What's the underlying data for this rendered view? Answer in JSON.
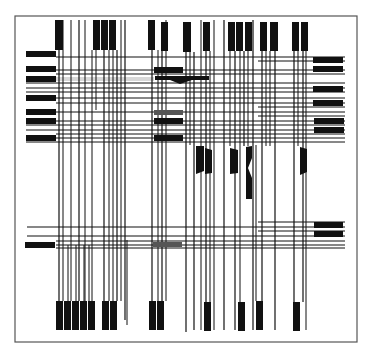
{
  "diagram": {
    "width": 372,
    "height": 353,
    "colors": {
      "background": "#ffffff",
      "frame": "#555555",
      "ink": "#111111",
      "grey_block": "#555555"
    },
    "frame": {
      "x": 15,
      "y": 16,
      "w": 342,
      "h": 326
    },
    "top_pins": [
      {
        "x": 55,
        "w": 8,
        "y1": 20,
        "y2": 50
      },
      {
        "x": 93,
        "w": 7,
        "y1": 20,
        "y2": 50
      },
      {
        "x": 101,
        "w": 7,
        "y1": 20,
        "y2": 50
      },
      {
        "x": 109,
        "w": 7,
        "y1": 20,
        "y2": 50
      },
      {
        "x": 148,
        "w": 7,
        "y1": 20,
        "y2": 50
      },
      {
        "x": 161,
        "w": 7,
        "y1": 22,
        "y2": 51
      },
      {
        "x": 183,
        "w": 8,
        "y1": 22,
        "y2": 52
      },
      {
        "x": 203,
        "w": 7,
        "y1": 22,
        "y2": 51
      },
      {
        "x": 228,
        "w": 7,
        "y1": 22,
        "y2": 51
      },
      {
        "x": 236,
        "w": 7,
        "y1": 22,
        "y2": 51
      },
      {
        "x": 245,
        "w": 7,
        "y1": 22,
        "y2": 51
      },
      {
        "x": 260,
        "w": 7,
        "y1": 22,
        "y2": 51
      },
      {
        "x": 270,
        "w": 8,
        "y1": 22,
        "y2": 51
      },
      {
        "x": 292,
        "w": 7,
        "y1": 22,
        "y2": 51
      },
      {
        "x": 301,
        "w": 7,
        "y1": 22,
        "y2": 51
      }
    ],
    "bottom_pins": [
      {
        "x": 56,
        "w": 7,
        "y1": 301,
        "y2": 330
      },
      {
        "x": 64,
        "w": 7,
        "y1": 301,
        "y2": 330
      },
      {
        "x": 72,
        "w": 7,
        "y1": 301,
        "y2": 330
      },
      {
        "x": 80,
        "w": 7,
        "y1": 301,
        "y2": 330
      },
      {
        "x": 88,
        "w": 7,
        "y1": 301,
        "y2": 330
      },
      {
        "x": 102,
        "w": 7,
        "y1": 301,
        "y2": 330
      },
      {
        "x": 110,
        "w": 7,
        "y1": 301,
        "y2": 330
      },
      {
        "x": 149,
        "w": 7,
        "y1": 301,
        "y2": 330
      },
      {
        "x": 157,
        "w": 7,
        "y1": 301,
        "y2": 330
      },
      {
        "x": 204,
        "w": 7,
        "y1": 302,
        "y2": 331
      },
      {
        "x": 238,
        "w": 7,
        "y1": 302,
        "y2": 331
      },
      {
        "x": 256,
        "w": 7,
        "y1": 301,
        "y2": 330
      },
      {
        "x": 293,
        "w": 7,
        "y1": 302,
        "y2": 331
      }
    ],
    "left_pins": [
      {
        "x": 26,
        "w": 30,
        "y": 51,
        "h": 6,
        "color": "ink"
      },
      {
        "x": 26,
        "w": 30,
        "y": 66,
        "h": 6,
        "color": "ink"
      },
      {
        "x": 26,
        "w": 30,
        "y": 76,
        "h": 6,
        "color": "ink"
      },
      {
        "x": 26,
        "w": 30,
        "y": 95,
        "h": 6,
        "color": "ink"
      },
      {
        "x": 26,
        "w": 30,
        "y": 109,
        "h": 6,
        "color": "ink"
      },
      {
        "x": 26,
        "w": 30,
        "y": 118,
        "h": 6,
        "color": "ink"
      },
      {
        "x": 26,
        "w": 30,
        "y": 135,
        "h": 6,
        "color": "ink"
      },
      {
        "x": 25,
        "w": 30,
        "y": 242,
        "h": 6,
        "color": "ink"
      }
    ],
    "right_pins": [
      {
        "x": 313,
        "w": 30,
        "y": 57,
        "h": 6
      },
      {
        "x": 313,
        "w": 30,
        "y": 66,
        "h": 6
      },
      {
        "x": 313,
        "w": 30,
        "y": 86,
        "h": 6
      },
      {
        "x": 313,
        "w": 30,
        "y": 100,
        "h": 6
      },
      {
        "x": 314,
        "w": 30,
        "y": 118,
        "h": 6
      },
      {
        "x": 314,
        "w": 30,
        "y": 127,
        "h": 6
      },
      {
        "x": 314,
        "w": 29,
        "y": 222,
        "h": 6
      },
      {
        "x": 314,
        "w": 29,
        "y": 231,
        "h": 6
      }
    ],
    "mid_blocks": [
      {
        "x": 154,
        "w": 29,
        "y": 67,
        "h": 6,
        "color": "ink"
      },
      {
        "x": 154,
        "w": 29,
        "y": 110,
        "h": 5,
        "color": "grey_block"
      },
      {
        "x": 154,
        "w": 29,
        "y": 118,
        "h": 6,
        "color": "ink"
      },
      {
        "x": 154,
        "w": 29,
        "y": 135,
        "h": 6,
        "color": "ink"
      },
      {
        "x": 153,
        "w": 29,
        "y": 242,
        "h": 5,
        "color": "grey_block"
      }
    ],
    "wedges": [
      {
        "points": "155,76 209,76 209,80 192,80 180,84 170,80 155,80",
        "color": "ink"
      },
      {
        "points": "196,146 204,146 204,171 196,174",
        "color": "ink"
      },
      {
        "points": "205,148 212,150 212,173 205,174",
        "color": "ink"
      },
      {
        "points": "230,148 238,150 238,173 230,174",
        "color": "ink"
      },
      {
        "points": "246,147 252,146 252,158 248,168 252,178 252,199 246,199",
        "color": "ink"
      },
      {
        "points": "300,147 307,149 307,172 300,175",
        "color": "ink"
      }
    ],
    "h_lines": [
      {
        "y": 57,
        "x1": 56,
        "x2": 345,
        "w": 1.2
      },
      {
        "y": 61,
        "x1": 258,
        "x2": 345,
        "w": 1.0
      },
      {
        "y": 70,
        "x1": 56,
        "x2": 345,
        "w": 1.2
      },
      {
        "y": 74,
        "x1": 56,
        "x2": 345,
        "w": 1.0
      },
      {
        "y": 79,
        "x1": 56,
        "x2": 154,
        "w": 1.0,
        "color": "#d8d8d8",
        "thick": 4
      },
      {
        "y": 83,
        "x1": 26,
        "x2": 345,
        "w": 1.0
      },
      {
        "y": 88,
        "x1": 26,
        "x2": 345,
        "w": 1.2
      },
      {
        "y": 92,
        "x1": 26,
        "x2": 345,
        "w": 1.0
      },
      {
        "y": 98,
        "x1": 56,
        "x2": 345,
        "w": 1.2
      },
      {
        "y": 103,
        "x1": 56,
        "x2": 345,
        "w": 1.0
      },
      {
        "y": 107,
        "x1": 258,
        "x2": 345,
        "w": 1.0
      },
      {
        "y": 112,
        "x1": 56,
        "x2": 345,
        "w": 1.2
      },
      {
        "y": 116,
        "x1": 258,
        "x2": 345,
        "w": 1.0
      },
      {
        "y": 121,
        "x1": 56,
        "x2": 345,
        "w": 1.2
      },
      {
        "y": 125,
        "x1": 26,
        "x2": 345,
        "w": 1.0
      },
      {
        "y": 130,
        "x1": 26,
        "x2": 345,
        "w": 1.2
      },
      {
        "y": 134,
        "x1": 56,
        "x2": 345,
        "w": 1.0
      },
      {
        "y": 138,
        "x1": 56,
        "x2": 345,
        "w": 1.2
      },
      {
        "y": 142,
        "x1": 26,
        "x2": 345,
        "w": 1.0
      },
      {
        "y": 222,
        "x1": 258,
        "x2": 345,
        "w": 1.0
      },
      {
        "y": 227,
        "x1": 27,
        "x2": 345,
        "w": 1.2
      },
      {
        "y": 231,
        "x1": 258,
        "x2": 345,
        "w": 1.0
      },
      {
        "y": 236,
        "x1": 27,
        "x2": 345,
        "w": 1.2
      },
      {
        "y": 241,
        "x1": 56,
        "x2": 345,
        "w": 1.0
      },
      {
        "y": 245,
        "x1": 56,
        "x2": 345,
        "w": 1.2
      },
      {
        "y": 248,
        "x1": 56,
        "x2": 345,
        "w": 1.0
      }
    ],
    "v_lines": [
      {
        "x": 59,
        "y1": 50,
        "y2": 301,
        "w": 1.2
      },
      {
        "x": 63,
        "y1": 20,
        "y2": 301,
        "w": 1.0
      },
      {
        "x": 71,
        "y1": 20,
        "y2": 301,
        "w": 1.0
      },
      {
        "x": 79,
        "y1": 20,
        "y2": 301,
        "w": 1.2
      },
      {
        "x": 85,
        "y1": 20,
        "y2": 301,
        "w": 1.0
      },
      {
        "x": 92,
        "y1": 50,
        "y2": 301,
        "w": 1.0
      },
      {
        "x": 96,
        "y1": 50,
        "y2": 110,
        "w": 1.0
      },
      {
        "x": 104,
        "y1": 50,
        "y2": 301,
        "w": 1.2
      },
      {
        "x": 109,
        "y1": 50,
        "y2": 301,
        "w": 1.0
      },
      {
        "x": 113,
        "y1": 50,
        "y2": 301,
        "w": 1.0
      },
      {
        "x": 117,
        "y1": 50,
        "y2": 301,
        "w": 1.2
      },
      {
        "x": 121,
        "y1": 20,
        "y2": 301,
        "w": 1.0
      },
      {
        "x": 125,
        "y1": 20,
        "y2": 320,
        "w": 1.2
      },
      {
        "x": 127,
        "y1": 240,
        "y2": 325,
        "w": 1.0
      },
      {
        "x": 68,
        "y1": 245,
        "y2": 301,
        "w": 1.0
      },
      {
        "x": 76,
        "y1": 245,
        "y2": 301,
        "w": 1.0
      },
      {
        "x": 84,
        "y1": 245,
        "y2": 301,
        "w": 1.0
      },
      {
        "x": 89,
        "y1": 245,
        "y2": 301,
        "w": 1.0
      },
      {
        "x": 152,
        "y1": 50,
        "y2": 301,
        "w": 1.2
      },
      {
        "x": 158,
        "y1": 50,
        "y2": 301,
        "w": 1.0
      },
      {
        "x": 162,
        "y1": 51,
        "y2": 301,
        "w": 1.2
      },
      {
        "x": 166,
        "y1": 20,
        "y2": 301,
        "w": 1.0
      },
      {
        "x": 186,
        "y1": 52,
        "y2": 332,
        "w": 1.2
      },
      {
        "x": 190,
        "y1": 52,
        "y2": 145,
        "w": 1.0
      },
      {
        "x": 194,
        "y1": 52,
        "y2": 330,
        "w": 1.2
      },
      {
        "x": 201,
        "y1": 20,
        "y2": 330,
        "w": 1.0
      },
      {
        "x": 206,
        "y1": 51,
        "y2": 302,
        "w": 1.2
      },
      {
        "x": 210,
        "y1": 51,
        "y2": 302,
        "w": 1.0
      },
      {
        "x": 214,
        "y1": 20,
        "y2": 330,
        "w": 1.0
      },
      {
        "x": 224,
        "y1": 20,
        "y2": 330,
        "w": 1.2
      },
      {
        "x": 230,
        "y1": 51,
        "y2": 146,
        "w": 1.0
      },
      {
        "x": 235,
        "y1": 51,
        "y2": 330,
        "w": 1.2
      },
      {
        "x": 240,
        "y1": 51,
        "y2": 302,
        "w": 1.0
      },
      {
        "x": 244,
        "y1": 51,
        "y2": 146,
        "w": 1.2
      },
      {
        "x": 248,
        "y1": 51,
        "y2": 146,
        "w": 1.0
      },
      {
        "x": 253,
        "y1": 20,
        "y2": 330,
        "w": 1.2
      },
      {
        "x": 256,
        "y1": 145,
        "y2": 301,
        "w": 1.0
      },
      {
        "x": 262,
        "y1": 51,
        "y2": 301,
        "w": 1.2
      },
      {
        "x": 266,
        "y1": 51,
        "y2": 146,
        "w": 1.0
      },
      {
        "x": 270,
        "y1": 51,
        "y2": 146,
        "w": 1.0
      },
      {
        "x": 275,
        "y1": 51,
        "y2": 330,
        "w": 1.2
      },
      {
        "x": 294,
        "y1": 51,
        "y2": 302,
        "w": 1.2
      },
      {
        "x": 298,
        "y1": 51,
        "y2": 146,
        "w": 1.0
      },
      {
        "x": 303,
        "y1": 51,
        "y2": 302,
        "w": 1.2
      },
      {
        "x": 306,
        "y1": 51,
        "y2": 330,
        "w": 1.0
      }
    ]
  }
}
